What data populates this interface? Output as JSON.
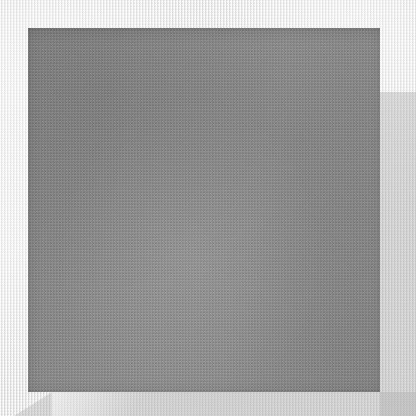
{
  "image": {
    "title": "Gray fabric swatch on light canvas background",
    "width": 416,
    "height": 416,
    "kind": "natural-image",
    "caption": ""
  },
  "background": {
    "name": "canvas-background",
    "description": "Light woven canvas / linen surface",
    "base_color": "#f0f0f0",
    "thread_light": "#ffffff",
    "thread_dark": "#c4c4c4",
    "texture": "woven-crosshatch"
  },
  "swatch": {
    "name": "gray-fabric-square",
    "description": "Medium gray textile square with fine vertical weave",
    "fill_color": "#858585",
    "edge_shadow_color": "#5a5a5a",
    "texture": "vertical-warp-striation",
    "left": 28,
    "top": 28,
    "width": 352,
    "height": 364
  },
  "shadows": [
    {
      "name": "right-margin-wedge",
      "description": "Diagonal gray shading in right margin below the fold line",
      "color": "#b0b0b0",
      "start_y": 92
    },
    {
      "name": "bottom-left-wedge",
      "description": "Diagonal gray shading across the bottom margin",
      "color": "#b2b2b2",
      "start_x": 52
    }
  ],
  "palette": {
    "background": "#f0f0f0",
    "swatch": "#858585",
    "shadow": "#b0b0b0",
    "highlight": "#ffffff",
    "edge": "#5a5a5a"
  }
}
